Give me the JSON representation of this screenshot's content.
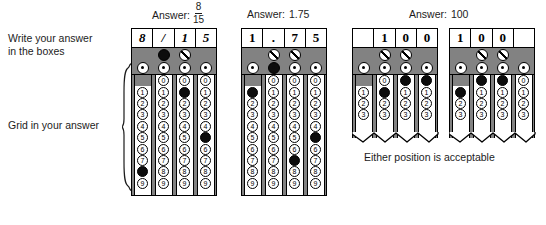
{
  "labels": {
    "write_instruction": "Write your answer\nin the boxes",
    "grid_instruction": "Grid in your answer",
    "either_position_note": "Either position is acceptable"
  },
  "captions": {
    "answer_word": "Answer:",
    "fraction_numerator": "8",
    "fraction_denominator": "15",
    "decimal_answer": "1.75",
    "integer_answer": "100"
  },
  "bubble_labels": {
    "slash": "/",
    "decimal": ".",
    "digits": [
      "0",
      "1",
      "2",
      "3",
      "4",
      "5",
      "6",
      "7",
      "8",
      "9"
    ]
  },
  "colors": {
    "shaded_band": "#828282",
    "filled_bubble": "#0d0d0d",
    "paper": "#ffffff",
    "ink": "#000000"
  },
  "grids": [
    {
      "id": "grid-fraction",
      "caption_kind": "fraction",
      "truncated": false,
      "visible_digit_rows": 10,
      "columns": [
        {
          "written": "8",
          "italic": true,
          "has_slash_bubble": false,
          "slash_filled": false,
          "has_decimal_bubble": true,
          "decimal_filled": false,
          "has_zero_bubble": false,
          "filled_digit": "8"
        },
        {
          "written": "/",
          "italic": true,
          "has_slash_bubble": true,
          "slash_filled": true,
          "has_decimal_bubble": true,
          "decimal_filled": false,
          "has_zero_bubble": true,
          "filled_digit": null
        },
        {
          "written": "1",
          "italic": true,
          "has_slash_bubble": true,
          "slash_filled": false,
          "has_decimal_bubble": true,
          "decimal_filled": false,
          "has_zero_bubble": true,
          "filled_digit": "1"
        },
        {
          "written": "5",
          "italic": true,
          "has_slash_bubble": false,
          "slash_filled": false,
          "has_decimal_bubble": true,
          "decimal_filled": false,
          "has_zero_bubble": true,
          "filled_digit": "5"
        }
      ]
    },
    {
      "id": "grid-decimal",
      "caption_kind": "decimal",
      "truncated": false,
      "visible_digit_rows": 10,
      "columns": [
        {
          "written": "1",
          "italic": false,
          "has_slash_bubble": false,
          "slash_filled": false,
          "has_decimal_bubble": true,
          "decimal_filled": false,
          "has_zero_bubble": false,
          "filled_digit": "1"
        },
        {
          "written": ".",
          "italic": false,
          "has_slash_bubble": true,
          "slash_filled": false,
          "has_decimal_bubble": true,
          "decimal_filled": true,
          "has_zero_bubble": true,
          "filled_digit": null
        },
        {
          "written": "7",
          "italic": false,
          "has_slash_bubble": true,
          "slash_filled": false,
          "has_decimal_bubble": true,
          "decimal_filled": false,
          "has_zero_bubble": true,
          "filled_digit": "7"
        },
        {
          "written": "5",
          "italic": false,
          "has_slash_bubble": false,
          "slash_filled": false,
          "has_decimal_bubble": true,
          "decimal_filled": false,
          "has_zero_bubble": true,
          "filled_digit": "5"
        }
      ]
    },
    {
      "id": "grid-integer-right",
      "caption_kind": "integer",
      "truncated": true,
      "visible_digit_rows": 4,
      "columns": [
        {
          "written": "",
          "italic": false,
          "has_slash_bubble": false,
          "slash_filled": false,
          "has_decimal_bubble": true,
          "decimal_filled": false,
          "has_zero_bubble": false,
          "filled_digit": null
        },
        {
          "written": "1",
          "italic": false,
          "has_slash_bubble": true,
          "slash_filled": false,
          "has_decimal_bubble": true,
          "decimal_filled": false,
          "has_zero_bubble": true,
          "filled_digit": "1"
        },
        {
          "written": "0",
          "italic": false,
          "has_slash_bubble": true,
          "slash_filled": false,
          "has_decimal_bubble": true,
          "decimal_filled": false,
          "has_zero_bubble": true,
          "filled_digit": "0"
        },
        {
          "written": "0",
          "italic": false,
          "has_slash_bubble": false,
          "slash_filled": false,
          "has_decimal_bubble": true,
          "decimal_filled": false,
          "has_zero_bubble": true,
          "filled_digit": "0"
        }
      ]
    },
    {
      "id": "grid-integer-left",
      "caption_kind": "none",
      "truncated": true,
      "visible_digit_rows": 4,
      "columns": [
        {
          "written": "1",
          "italic": false,
          "has_slash_bubble": false,
          "slash_filled": false,
          "has_decimal_bubble": true,
          "decimal_filled": false,
          "has_zero_bubble": false,
          "filled_digit": "1"
        },
        {
          "written": "0",
          "italic": false,
          "has_slash_bubble": true,
          "slash_filled": false,
          "has_decimal_bubble": true,
          "decimal_filled": false,
          "has_zero_bubble": true,
          "filled_digit": "0"
        },
        {
          "written": "0",
          "italic": false,
          "has_slash_bubble": true,
          "slash_filled": false,
          "has_decimal_bubble": true,
          "decimal_filled": false,
          "has_zero_bubble": true,
          "filled_digit": "0"
        },
        {
          "written": "",
          "italic": false,
          "has_slash_bubble": false,
          "slash_filled": false,
          "has_decimal_bubble": true,
          "decimal_filled": false,
          "has_zero_bubble": true,
          "filled_digit": null
        }
      ]
    }
  ],
  "geometry": {
    "grid_positions": [
      {
        "left": 131,
        "top": 28,
        "width": 86,
        "height": 168
      },
      {
        "left": 241,
        "top": 28,
        "width": 86,
        "height": 168
      },
      {
        "left": 352,
        "top": 28,
        "width": 86,
        "height": 110
      },
      {
        "left": 449,
        "top": 28,
        "width": 86,
        "height": 110
      }
    ]
  }
}
